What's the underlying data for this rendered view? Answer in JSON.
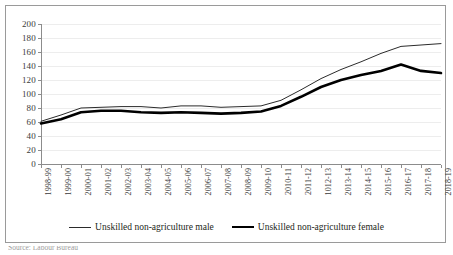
{
  "chart_data": {
    "type": "line",
    "title": "",
    "subtitle": "",
    "xlabel": "",
    "ylabel": "",
    "ylim": [
      0,
      200
    ],
    "ytick_step": 20,
    "yticks": [
      0,
      20,
      40,
      60,
      80,
      100,
      120,
      140,
      160,
      180,
      200
    ],
    "grid": true,
    "grid_orientation": "horizontal",
    "legend_position": "bottom-center",
    "categories": [
      "1998-99",
      "1999-00",
      "2000-01",
      "2001-02",
      "2002-03",
      "2003-04",
      "2004-05",
      "2005-06",
      "2006-07",
      "2007-08",
      "2008-09",
      "2009-10",
      "2010-11",
      "2011-12",
      "1012-13",
      "2013-14",
      "2014-15",
      "2015-16",
      "2016-17",
      "2017-18",
      "2018-19"
    ],
    "series": [
      {
        "name": "Unskilled non-agriculture male",
        "style": "thin",
        "color": "#2b2b2b",
        "values": [
          61,
          70,
          80,
          81,
          82,
          82,
          80,
          83,
          83,
          81,
          82,
          83,
          91,
          106,
          122,
          135,
          146,
          158,
          168,
          170,
          172
        ]
      },
      {
        "name": "Unskilled non-agriculture female",
        "style": "thick",
        "color": "#000000",
        "values": [
          58,
          64,
          74,
          76,
          76,
          74,
          73,
          74,
          73,
          72,
          73,
          75,
          83,
          96,
          110,
          120,
          127,
          133,
          142,
          133,
          130
        ]
      }
    ]
  },
  "legend": {
    "items": [
      {
        "label": "Unskilled non-agriculture male",
        "style": "thin"
      },
      {
        "label": "Unskilled non-agriculture female",
        "style": "thick"
      }
    ]
  },
  "source": {
    "text": "Source: Labour Bureau"
  }
}
